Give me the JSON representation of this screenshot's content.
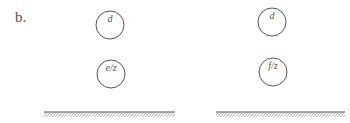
{
  "figure": {
    "panel_label": "b.",
    "left": {
      "top_circle": {
        "label": "d",
        "cx": 110,
        "cy": 25,
        "r": 14
      },
      "bottom_circle": {
        "label": "e/z",
        "cx": 111,
        "cy": 74,
        "r": 14
      },
      "ground": {
        "x": 44,
        "y": 112,
        "width": 131,
        "height": 5
      }
    },
    "right": {
      "top_circle": {
        "label": "d",
        "cx": 272,
        "cy": 22,
        "r": 14
      },
      "bottom_circle": {
        "label": "f/z",
        "cx": 273,
        "cy": 72,
        "r": 14
      },
      "ground": {
        "x": 216,
        "y": 112,
        "width": 129,
        "height": 5
      }
    },
    "colors": {
      "stroke": "#555555",
      "hatch": "#777777",
      "background": "#ffffff"
    }
  }
}
